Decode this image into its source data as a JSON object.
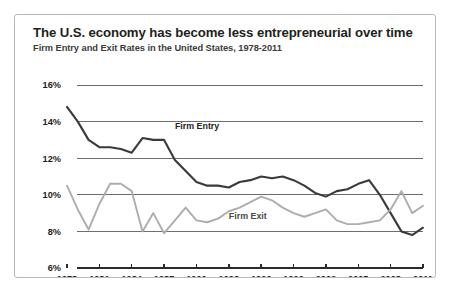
{
  "card": {
    "title": "The U.S.  economy has become less entrepreneurial over time",
    "subtitle": "Firm Entry and Exit Rates in the United States, 1978-2011"
  },
  "chart_data": {
    "type": "line",
    "title": "The U.S.  economy has become less entrepreneurial over time",
    "subtitle": "Firm Entry and Exit Rates in the United States, 1978-2011",
    "xlabel": "",
    "ylabel": "",
    "ylim": [
      6,
      16
    ],
    "y_ticks": [
      6,
      8,
      10,
      12,
      14,
      16
    ],
    "y_tick_labels": [
      "6%",
      "8%",
      "10%",
      "12%",
      "14%",
      "16%"
    ],
    "grid": "horizontal",
    "legend_position": "inline",
    "xlim": [
      1978,
      2011
    ],
    "x_tick_labels": [
      "1978",
      "1981",
      "1984",
      "1987",
      "1990",
      "1993",
      "1996",
      "1999",
      "2002",
      "2005",
      "2008",
      "2011"
    ],
    "x": [
      1978,
      1979,
      1980,
      1981,
      1982,
      1983,
      1984,
      1985,
      1986,
      1987,
      1988,
      1989,
      1990,
      1991,
      1992,
      1993,
      1994,
      1995,
      1996,
      1997,
      1998,
      1999,
      2000,
      2001,
      2002,
      2003,
      2004,
      2005,
      2006,
      2007,
      2008,
      2009,
      2010,
      2011
    ],
    "series": [
      {
        "name": "Firm Entry",
        "color": "#3a3a3a",
        "label_x": 1988,
        "label_y": 13.6,
        "values": [
          14.8,
          14.0,
          13.0,
          12.6,
          12.6,
          12.5,
          12.3,
          13.1,
          13.0,
          13.0,
          11.9,
          11.3,
          10.7,
          10.5,
          10.5,
          10.4,
          10.7,
          10.8,
          11.0,
          10.9,
          11.0,
          10.8,
          10.5,
          10.1,
          9.9,
          10.2,
          10.3,
          10.6,
          10.8,
          10.0,
          9.0,
          8.0,
          7.8,
          8.2
        ]
      },
      {
        "name": "Firm Exit",
        "color": "#adadad",
        "label_x": 1993,
        "label_y": 8.7,
        "values": [
          10.5,
          9.2,
          8.1,
          9.5,
          10.6,
          10.6,
          10.2,
          8.0,
          9.0,
          7.9,
          8.6,
          9.3,
          8.6,
          8.5,
          8.7,
          9.1,
          9.3,
          9.6,
          9.9,
          9.7,
          9.3,
          9.0,
          8.8,
          9.0,
          9.2,
          8.6,
          8.4,
          8.4,
          8.5,
          8.6,
          9.2,
          10.2,
          9.0,
          9.4
        ]
      }
    ]
  }
}
